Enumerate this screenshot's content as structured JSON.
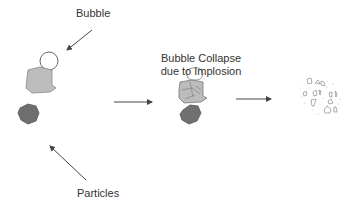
{
  "labels": {
    "bubble": "Bubble",
    "particles": "Particles",
    "collapse_line1": "Bubble Collapse",
    "collapse_line2": "due to Implosion"
  },
  "stages": [
    {
      "name": "initial",
      "elements": [
        "bubble",
        "light-particle",
        "dark-particle"
      ]
    },
    {
      "name": "collapse",
      "elements": [
        "imploding-bubble",
        "fragmenting-particle",
        "dark-particle"
      ]
    },
    {
      "name": "result",
      "elements": [
        "dispersed-fragments"
      ]
    }
  ],
  "colors": {
    "light_particle": "#bdbdbd",
    "dark_particle": "#6e6e6e",
    "stroke": "#555555",
    "arrow": "#444444",
    "text": "#333333"
  }
}
